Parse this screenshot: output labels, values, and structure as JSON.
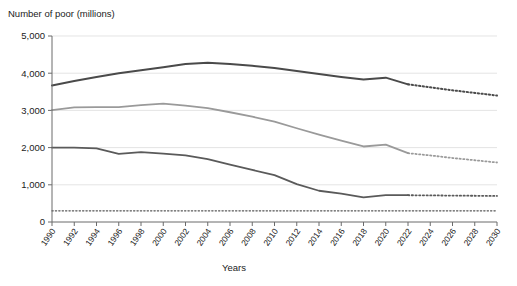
{
  "chart_data": {
    "type": "line",
    "title": "",
    "ylabel": "Number of poor (millions)",
    "xlabel": "Years",
    "ylim": [
      0,
      5000
    ],
    "xlim": [
      1990,
      2030
    ],
    "y_ticks": [
      "0",
      "1,000",
      "2,000",
      "3,000",
      "4,000",
      "5,000"
    ],
    "y_tick_values": [
      0,
      1000,
      2000,
      3000,
      4000,
      5000
    ],
    "grid": "horizontal",
    "legend_position": "none",
    "x": [
      1990,
      1992,
      1994,
      1996,
      1998,
      2000,
      2002,
      2004,
      2006,
      2008,
      2010,
      2012,
      2014,
      2016,
      2018,
      2020,
      2022,
      2024,
      2026,
      2028,
      2030
    ],
    "x_tick_labels": [
      "1990",
      "1992",
      "1994",
      "1996",
      "1998",
      "2000",
      "2002",
      "2004",
      "2006",
      "2008",
      "2010",
      "2012",
      "2014",
      "2016",
      "2018",
      "2020",
      "2022",
      "2024",
      "2026",
      "2028",
      "2030"
    ],
    "projection_start_year": 2022,
    "series": [
      {
        "name": "upper-poverty-line",
        "color": "#4a4a4a",
        "width": 2.0,
        "values": [
          3670,
          3790,
          3900,
          4000,
          4080,
          4160,
          4250,
          4280,
          4250,
          4200,
          4140,
          4060,
          3980,
          3900,
          3830,
          3880,
          3700,
          3620,
          3540,
          3470,
          3400
        ]
      },
      {
        "name": "middle-poverty-line",
        "color": "#9a9a9a",
        "width": 1.8,
        "values": [
          3010,
          3080,
          3090,
          3090,
          3140,
          3180,
          3130,
          3060,
          2950,
          2830,
          2700,
          2520,
          2350,
          2190,
          2030,
          2080,
          1850,
          1790,
          1720,
          1660,
          1600
        ]
      },
      {
        "name": "lower-poverty-line",
        "color": "#5a5a5a",
        "width": 1.8,
        "values": [
          2000,
          2000,
          1980,
          1830,
          1880,
          1840,
          1790,
          1690,
          1540,
          1400,
          1260,
          1020,
          840,
          760,
          660,
          720,
          720,
          715,
          710,
          705,
          700
        ]
      },
      {
        "name": "extreme-poverty-baseline",
        "color": "#555555",
        "width": 1.4,
        "style": "dotted",
        "values": [
          300,
          300,
          300,
          300,
          300,
          300,
          300,
          300,
          300,
          300,
          300,
          300,
          300,
          300,
          300,
          300,
          300,
          300,
          300,
          300,
          300
        ]
      }
    ]
  },
  "axes": {
    "y_axis_label": "Number of poor (millions)",
    "x_axis_label": "Years"
  }
}
